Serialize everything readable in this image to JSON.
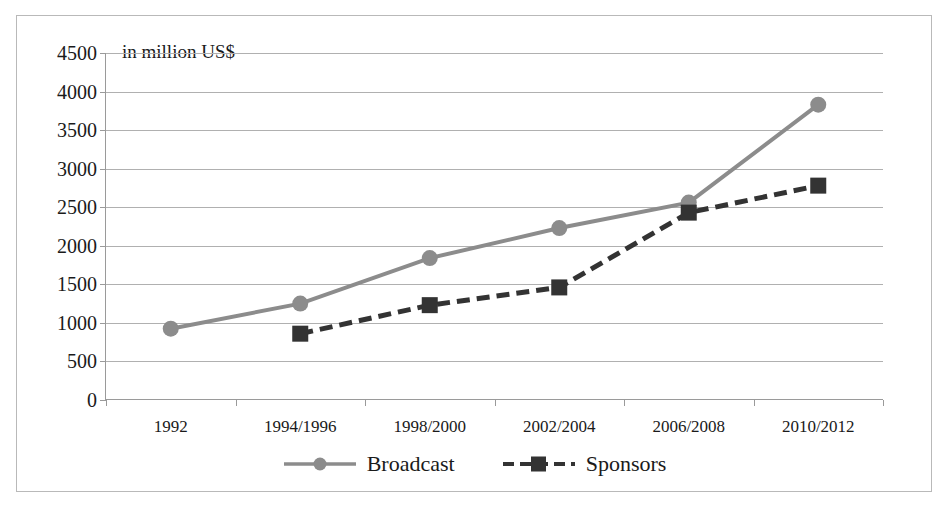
{
  "chart_data": {
    "type": "line",
    "title": "",
    "subtitle": "",
    "axis_note": "in million US$",
    "xlabel": "",
    "ylabel": "",
    "categories": [
      "1992",
      "1994/1996",
      "1998/2000",
      "2002/2004",
      "2006/2008",
      "2010/2012"
    ],
    "ylim": [
      0,
      4500
    ],
    "yticks": [
      0,
      500,
      1000,
      1500,
      2000,
      2500,
      3000,
      3500,
      4000,
      4500
    ],
    "ytick_labels": [
      "0",
      "500",
      "1000",
      "1500",
      "2000",
      "2500",
      "3000",
      "3500",
      "4000",
      "4500"
    ],
    "grid": true,
    "legend_position": "bottom",
    "series": [
      {
        "name": "Broadcast",
        "color": "#8c8c8c",
        "line_style": "solid",
        "marker": "circle",
        "values": [
          925,
          1250,
          1840,
          2230,
          2560,
          3830
        ]
      },
      {
        "name": "Sponsors",
        "color": "#333333",
        "line_style": "dashed",
        "marker": "square",
        "values": [
          null,
          860,
          1230,
          1460,
          2430,
          2780
        ]
      }
    ]
  },
  "legend": {
    "items": [
      {
        "label": "Broadcast"
      },
      {
        "label": "Sponsors"
      }
    ]
  }
}
